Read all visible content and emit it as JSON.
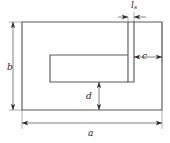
{
  "figure": {
    "kind": "engineering-dimension-drawing",
    "line_color": "#4d4d4d",
    "dimension_line_color": "#3a3a3a",
    "background_color": "#ffffff",
    "labels": {
      "overall_width": "a",
      "overall_height": "b",
      "right_margin": "c",
      "bottom_margin": "d",
      "slot_width_main": "l",
      "slot_width_subscript": "s"
    },
    "geometry": {
      "outer": {
        "x": 22,
        "y": 22,
        "width": 140,
        "height": 88
      },
      "inner_slot": {
        "x": 50,
        "y": 55,
        "width": 78,
        "height": 27
      },
      "neck_slot": {
        "x": 128,
        "y": 22,
        "width": 6,
        "height": 33
      }
    },
    "dimensions": [
      {
        "name": "a",
        "orientation": "horizontal",
        "from": 22,
        "to": 162,
        "at": 123
      },
      {
        "name": "b",
        "orientation": "vertical",
        "from": 22,
        "to": 110,
        "at": 13
      },
      {
        "name": "c",
        "orientation": "horizontal",
        "from": 134,
        "to": 162,
        "at": 57
      },
      {
        "name": "d",
        "orientation": "vertical",
        "from": 82,
        "to": 110,
        "at": 99
      },
      {
        "name": "l",
        "orientation": "horizontal",
        "from": 128,
        "to": 134,
        "at": 17
      }
    ]
  }
}
